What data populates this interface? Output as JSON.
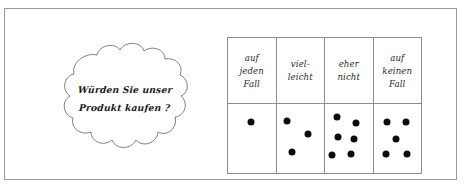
{
  "figure": {
    "type": "survey-tally-diagram",
    "background_color": "#ffffff",
    "frame_color": "#9a9a9a",
    "line_color": "#8d8d8d",
    "dot_color": "#0d0d0d"
  },
  "speech_bubble": {
    "shape": "cloud",
    "lines": [
      "Würden Sie unser",
      "Produkt kaufen ?"
    ],
    "full_text": "Würden Sie unser Produkt kaufen ?"
  },
  "table": {
    "columns": [
      {
        "id": "auf-jeden-fall",
        "header_lines": [
          "auf",
          "jeden",
          "Fall"
        ],
        "header_text": "auf jeden Fall",
        "count": 1,
        "dots": [
          {
            "x": 48,
            "y": 26
          }
        ]
      },
      {
        "id": "vielleicht",
        "header_lines": [
          "viel-",
          "leicht"
        ],
        "header_text": "vielleicht",
        "count": 3,
        "dots": [
          {
            "x": 22,
            "y": 25
          },
          {
            "x": 66,
            "y": 44
          },
          {
            "x": 33,
            "y": 70
          }
        ]
      },
      {
        "id": "eher-nicht",
        "header_lines": [
          "eher",
          "nicht"
        ],
        "header_text": "eher nicht",
        "count": 6,
        "dots": [
          {
            "x": 26,
            "y": 19
          },
          {
            "x": 66,
            "y": 27
          },
          {
            "x": 28,
            "y": 48
          },
          {
            "x": 60,
            "y": 50
          },
          {
            "x": 14,
            "y": 74
          },
          {
            "x": 55,
            "y": 72
          }
        ]
      },
      {
        "id": "auf-keinen-fall",
        "header_lines": [
          "auf",
          "keinen",
          "Fall"
        ],
        "header_text": "auf keinen Fall",
        "count": 5,
        "dots": [
          {
            "x": 28,
            "y": 26
          },
          {
            "x": 68,
            "y": 26
          },
          {
            "x": 48,
            "y": 50
          },
          {
            "x": 26,
            "y": 72
          },
          {
            "x": 70,
            "y": 72
          }
        ]
      }
    ]
  }
}
